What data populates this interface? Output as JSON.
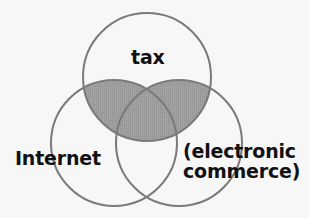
{
  "diagram": {
    "type": "venn",
    "sets": [
      {
        "id": "tax",
        "label": "tax"
      },
      {
        "id": "internet",
        "label": "Internet"
      },
      {
        "id": "ecommerce",
        "label_line1": "(electronic",
        "label_line2": "commerce)"
      }
    ],
    "highlighted_region": "tax ∩ (Internet ∪ electronic commerce)",
    "colors": {
      "background": "#f7f7f7",
      "stroke": "#7a7a7a",
      "shade": "#9c9c9c",
      "text": "#111111"
    }
  }
}
